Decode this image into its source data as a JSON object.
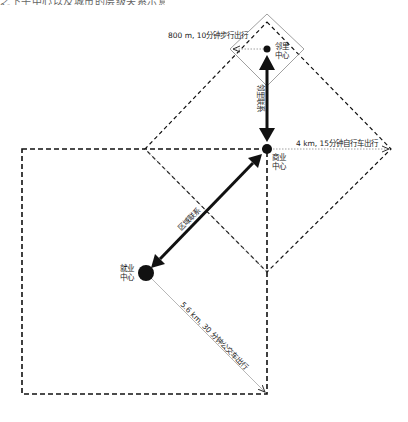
{
  "top_fragment": "之下午中心以及城市的层级关系示意图",
  "nodes": {
    "neighborhood": {
      "line1": "邻里",
      "line2": "中心"
    },
    "business": {
      "line1": "商业",
      "line2": "中心"
    },
    "employment": {
      "line1": "就业",
      "line2": "中心"
    }
  },
  "distances": {
    "walk": "800 m, 10分钟步行出行",
    "bike": "4 km, 15分钟自行车出行",
    "transit": "5.6 km, 30 分钟公交车出行"
  },
  "links": {
    "neighborhood_link": "邻里联系",
    "district_link": "区域联系"
  },
  "colors": {
    "line": "#111111",
    "dotted": "#888888",
    "background": "#ffffff"
  }
}
